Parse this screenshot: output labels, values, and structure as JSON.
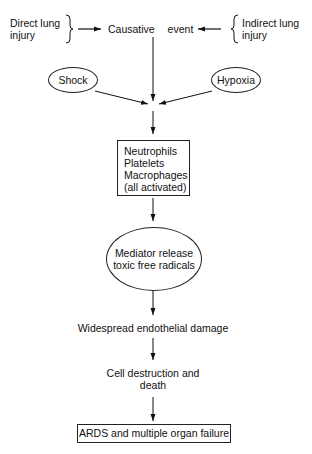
{
  "diagram": {
    "inputs": {
      "left": {
        "line1": "Direct lung",
        "line2": "injury"
      },
      "right": {
        "line1": "Indirect lung",
        "line2": "injury"
      }
    },
    "nodes": {
      "causative_event": "Causative event",
      "shock": "Shock",
      "hypoxia": "Hypoxia",
      "cells": {
        "line1": "Neutrophils",
        "line2": "Platelets",
        "line3": "Macrophages",
        "line4": "(all activated)"
      },
      "mediator": {
        "line1": "Mediator release",
        "line2": "toxic free radicals"
      },
      "endothelial": "Widespread endothelial damage",
      "cell_death": {
        "line1": "Cell destruction and",
        "line2": "death"
      },
      "outcome": "ARDS and multiple organ failure"
    },
    "edges": [
      {
        "from": "Direct lung injury",
        "to": "Causative event"
      },
      {
        "from": "Indirect lung injury",
        "to": "Causative event"
      },
      {
        "from": "Causative event",
        "to": "Neutrophils/Platelets/Macrophages"
      },
      {
        "from": "Shock",
        "to": "Neutrophils/Platelets/Macrophages"
      },
      {
        "from": "Hypoxia",
        "to": "Neutrophils/Platelets/Macrophages"
      },
      {
        "from": "Neutrophils/Platelets/Macrophages",
        "to": "Mediator release toxic free radicals"
      },
      {
        "from": "Mediator release toxic free radicals",
        "to": "Widespread endothelial damage"
      },
      {
        "from": "Widespread endothelial damage",
        "to": "Cell destruction and death"
      },
      {
        "from": "Cell destruction and death",
        "to": "ARDS and multiple organ failure"
      }
    ]
  }
}
